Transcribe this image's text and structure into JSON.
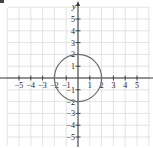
{
  "chart_data": {
    "type": "line",
    "title": "",
    "xlabel": "x",
    "ylabel": "y",
    "xlim": [
      -6,
      6
    ],
    "ylim": [
      -6,
      6
    ],
    "grid": true,
    "x_ticks": [
      -5,
      -4,
      -3,
      -2,
      -1,
      1,
      2,
      3,
      4,
      5
    ],
    "y_ticks": [
      -5,
      -4,
      -3,
      -2,
      -1,
      1,
      2,
      3,
      4,
      5
    ],
    "x_tick_labels": [
      "−5",
      "−4",
      "−3",
      "−2",
      "−1",
      "1",
      "2",
      "3",
      "4",
      "5"
    ],
    "y_tick_labels": [
      "−5",
      "−4",
      "−3",
      "−2",
      "−1",
      "1",
      "2",
      "3",
      "4",
      "5"
    ],
    "series": [
      {
        "name": "circle",
        "shape": "circle",
        "center": [
          0,
          0
        ],
        "radius": 2,
        "equation": "x^2 + y^2 = 4"
      }
    ]
  },
  "colors": {
    "grid": "#dcdcdc",
    "axis": "#333333",
    "curve": "#6e6e6e",
    "text": "#222222"
  },
  "axis_labels": {
    "y": "y"
  }
}
